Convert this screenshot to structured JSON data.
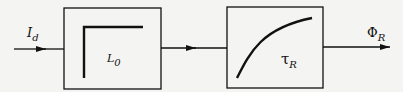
{
  "input": {
    "symbol": "I",
    "subscript": "d"
  },
  "block1": {
    "symbol": "L",
    "subscript": "0",
    "type": "step"
  },
  "block2": {
    "symbol": "τ",
    "subscript": "R",
    "type": "exponential-rise"
  },
  "output": {
    "symbol": "Φ",
    "subscript": "R"
  },
  "colors": {
    "line": "#111111",
    "background": "#f4f4f2"
  }
}
